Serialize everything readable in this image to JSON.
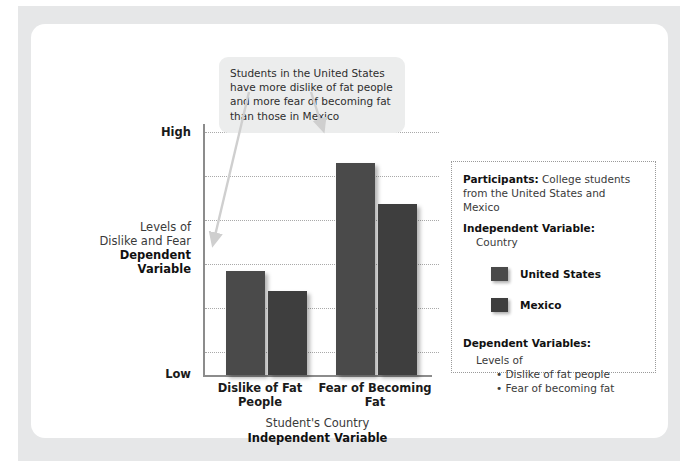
{
  "callout": {
    "text": "Students in the United States have more dislike of fat people and more fear of becoming fat than those in Mexico"
  },
  "axes": {
    "y_high": "High",
    "y_low": "Low",
    "y_title_plain": "Levels of Dislike and Fear",
    "y_title_bold": "Dependent Variable",
    "x_title_plain": "Student's Country",
    "x_title_bold": "Independent Variable"
  },
  "infobox": {
    "participants_label": "Participants:",
    "participants_value": " College students from the United States and Mexico",
    "iv_label": "Independent Variable:",
    "iv_value": "Country",
    "legend": [
      {
        "label": "United States",
        "color": "#4a4a4a"
      },
      {
        "label": "Mexico",
        "color": "#3e3e3e"
      }
    ],
    "dv_label": "Dependent Variables:",
    "dv_value": "Levels of",
    "dv_bullets": [
      "• Dislike of fat people",
      "• Fear of becoming fat"
    ]
  },
  "chart_data": {
    "type": "bar",
    "title": "",
    "xlabel": "Student's Country / Independent Variable",
    "ylabel": "Levels of Dislike and Fear / Dependent Variable",
    "categories": [
      "Dislike of Fat People",
      "Fear of Becoming Fat"
    ],
    "series": [
      {
        "name": "United States",
        "color": "#4a4a4a",
        "values": [
          43,
          88
        ]
      },
      {
        "name": "Mexico",
        "color": "#3e3e3e",
        "values": [
          35,
          71
        ]
      }
    ],
    "ylim": [
      0,
      100
    ],
    "ytick_labels": [
      "Low",
      "High"
    ],
    "gridlines": 6,
    "grid": true,
    "legend_position": "right-box"
  }
}
